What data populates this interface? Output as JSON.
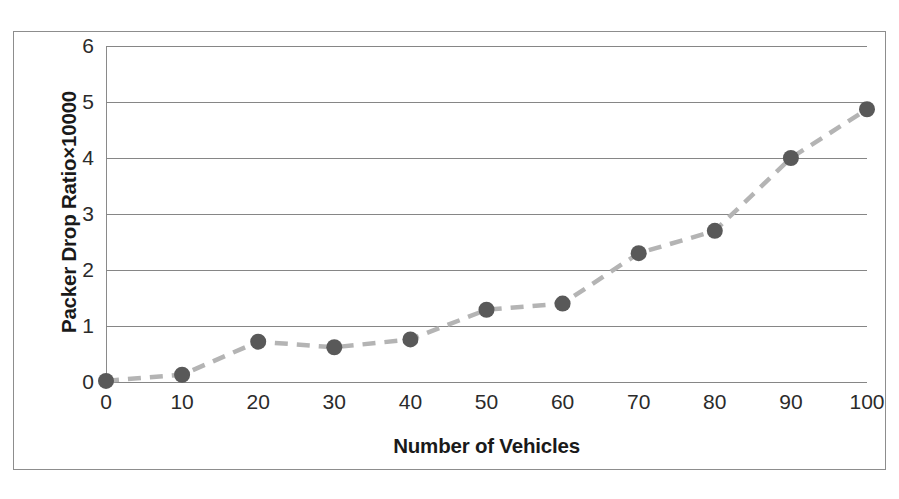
{
  "chart_data": {
    "type": "line",
    "title": "",
    "xlabel": "Number of Vehicles",
    "ylabel": "Packer Drop Ratio×10000",
    "x": [
      0,
      10,
      20,
      30,
      40,
      50,
      60,
      70,
      80,
      90,
      100
    ],
    "values": [
      0.02,
      0.13,
      0.72,
      0.62,
      0.76,
      1.29,
      1.4,
      2.3,
      2.7,
      4.0,
      4.87
    ],
    "series": [
      {
        "name": "Packet Drop Ratio",
        "values": [
          0.02,
          0.13,
          0.72,
          0.62,
          0.76,
          1.29,
          1.4,
          2.3,
          2.7,
          4.0,
          4.87
        ]
      }
    ],
    "xlim": [
      0,
      100
    ],
    "ylim": [
      0,
      6
    ],
    "xticks": [
      "0",
      "10",
      "20",
      "30",
      "40",
      "50",
      "60",
      "70",
      "80",
      "90",
      "100"
    ],
    "yticks": [
      "0",
      "1",
      "2",
      "3",
      "4",
      "5",
      "6"
    ],
    "grid": "horizontal",
    "legend": "none",
    "marker_color": "#595959",
    "line_color": "#b4b4b4",
    "line_style": "dashed",
    "grid_color": "#868686",
    "frame_color": "#8d8d8d"
  },
  "axes": {
    "x_title": "Number of Vehicles",
    "y_title": "Packer Drop Ratio×10000"
  }
}
